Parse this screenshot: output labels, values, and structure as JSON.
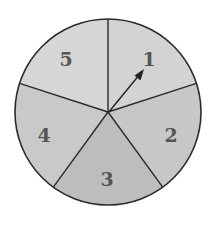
{
  "spinner": {
    "center": [
      108,
      112
    ],
    "radius": 93,
    "outline_color": "#2a2a2a",
    "label_color": "#555555",
    "sectors": [
      {
        "label": "1",
        "color": "#d3d3d3"
      },
      {
        "label": "2",
        "color": "#c7c7c7"
      },
      {
        "label": "3",
        "color": "#bdbdbd"
      },
      {
        "label": "4",
        "color": "#c9c9c9"
      },
      {
        "label": "5",
        "color": "#d6d6d6"
      }
    ],
    "arrow": {
      "from": [
        108,
        113
      ],
      "to": [
        143,
        71
      ],
      "color": "#222222"
    }
  }
}
